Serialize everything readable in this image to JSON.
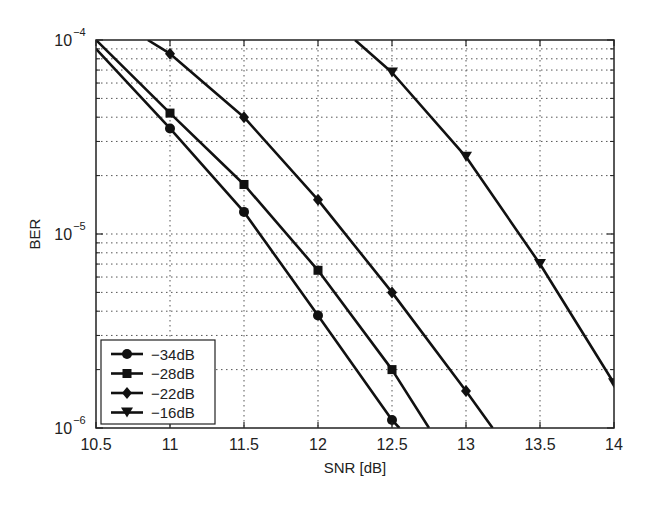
{
  "chart_data": {
    "type": "line",
    "title": "",
    "xlabel": "SNR [dB]",
    "ylabel": "BER",
    "xlim": [
      10.5,
      14
    ],
    "ylim": [
      1e-06,
      0.0001
    ],
    "yscale": "log",
    "grid": true,
    "legend_position": "lower left",
    "x_ticks": [
      "10.5",
      "11",
      "11.5",
      "12",
      "12.5",
      "13",
      "13.5",
      "14"
    ],
    "y_ticks": [
      "10^-6",
      "10^-5",
      "10^-4"
    ],
    "series": [
      {
        "name": "-34dB",
        "marker": "circle",
        "x": [
          11,
          11.5,
          12,
          12.5
        ],
        "y": [
          3.5e-05,
          1.3e-05,
          3.8e-06,
          1.1e-06
        ],
        "line_x": [
          10.5,
          11,
          11.5,
          12,
          12.5,
          12.55
        ],
        "line_y": [
          9e-05,
          3.5e-05,
          1.3e-05,
          3.8e-06,
          1.1e-06,
          1e-06
        ]
      },
      {
        "name": "-28dB",
        "marker": "square",
        "x": [
          11,
          11.5,
          12,
          12.5
        ],
        "y": [
          4.2e-05,
          1.8e-05,
          6.5e-06,
          2e-06
        ],
        "line_x": [
          10.5,
          11,
          11.5,
          12,
          12.5,
          12.75
        ],
        "line_y": [
          0.0001,
          4.2e-05,
          1.8e-05,
          6.5e-06,
          2e-06,
          1e-06
        ]
      },
      {
        "name": "-22dB",
        "marker": "diamond",
        "x": [
          11,
          11.5,
          12,
          12.5,
          13
        ],
        "y": [
          8.5e-05,
          4e-05,
          1.5e-05,
          5e-06,
          1.55e-06
        ],
        "line_x": [
          10.85,
          11,
          11.5,
          12,
          12.5,
          13,
          13.18
        ],
        "line_y": [
          0.0001,
          8.5e-05,
          4e-05,
          1.5e-05,
          5e-06,
          1.55e-06,
          1e-06
        ]
      },
      {
        "name": "-16dB",
        "marker": "triangle-down",
        "x": [
          12.5,
          13,
          13.5,
          14
        ],
        "y": [
          6.8e-05,
          2.5e-05,
          7e-06,
          1.7e-06
        ],
        "line_x": [
          12.25,
          12.5,
          13,
          13.5,
          14
        ],
        "line_y": [
          0.0001,
          6.8e-05,
          2.5e-05,
          7e-06,
          1.7e-06
        ]
      }
    ]
  }
}
